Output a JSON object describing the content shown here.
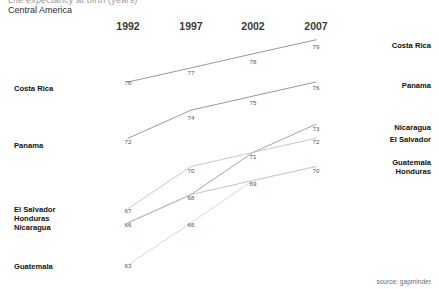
{
  "header": {
    "clipped_title": "Life expectancy at birth (years)",
    "subtitle": "Central America"
  },
  "source_note": "source: gapminder",
  "axis": {
    "years": [
      "1992",
      "1997",
      "2002",
      "2007"
    ]
  },
  "left_labels": [
    {
      "name": "Costa Rica",
      "y": 89
    },
    {
      "name": "Panama",
      "y": 146
    },
    {
      "name": "El Salvador",
      "y": 210
    },
    {
      "name": "Honduras",
      "y": 219
    },
    {
      "name": "Nicaragua",
      "y": 228
    },
    {
      "name": "Guatemala",
      "y": 267
    }
  ],
  "right_labels": [
    {
      "name": "Costa Rica",
      "y": 46
    },
    {
      "name": "Panama",
      "y": 86
    },
    {
      "name": "Nicaragua",
      "y": 128
    },
    {
      "name": "El Salvador",
      "y": 140
    },
    {
      "name": "Guatemala",
      "y": 163
    },
    {
      "name": "Honduras",
      "y": 172
    }
  ],
  "chart_data": {
    "type": "line",
    "title": "Life expectancy at birth (years)",
    "subtitle": "Central America",
    "xlabel": "",
    "ylabel": "",
    "x": [
      1992,
      1997,
      2002,
      2007
    ],
    "categories": [
      "1992",
      "1997",
      "2002",
      "2007"
    ],
    "ylim": [
      62,
      80
    ],
    "grid": false,
    "legend": "inline-side-labels",
    "annotation": "source: gapminder",
    "series": [
      {
        "name": "Costa Rica",
        "values": [
          76,
          77,
          78,
          79
        ],
        "color": "#8c8c8c"
      },
      {
        "name": "Panama",
        "values": [
          72,
          74,
          75,
          76
        ],
        "color": "#8c8c8c"
      },
      {
        "name": "Nicaragua",
        "values": [
          66,
          68,
          71,
          73
        ],
        "color": "#9a9a9a"
      },
      {
        "name": "El Salvador",
        "values": [
          67,
          70,
          71,
          72
        ],
        "color": "#c2c2c2"
      },
      {
        "name": "Honduras",
        "values": [
          66,
          68,
          69,
          70
        ],
        "color": "#bdbdbd"
      },
      {
        "name": "Guatemala",
        "values": [
          63,
          66,
          69,
          70
        ],
        "color": "#d2d2d2"
      }
    ],
    "point_labels": [
      {
        "series": "Costa Rica",
        "year": "1992",
        "text": "76",
        "x": 128,
        "y": 82
      },
      {
        "series": "Costa Rica",
        "year": "1997",
        "text": "77",
        "x": 191,
        "y": 72
      },
      {
        "series": "Costa Rica",
        "year": "2002",
        "text": "78",
        "x": 253,
        "y": 61
      },
      {
        "series": "Costa Rica",
        "year": "2007",
        "text": "79",
        "x": 316,
        "y": 46
      },
      {
        "series": "Panama",
        "year": "1992",
        "text": "72",
        "x": 128,
        "y": 141
      },
      {
        "series": "Panama",
        "year": "1997",
        "text": "74",
        "x": 191,
        "y": 117
      },
      {
        "series": "Panama",
        "year": "2002",
        "text": "75",
        "x": 253,
        "y": 102
      },
      {
        "series": "Panama",
        "year": "2007",
        "text": "76",
        "x": 316,
        "y": 87
      },
      {
        "series": "El Salvador",
        "year": "1992",
        "text": "67",
        "x": 128,
        "y": 210
      },
      {
        "series": "El Salvador",
        "year": "1997",
        "text": "70",
        "x": 191,
        "y": 170
      },
      {
        "series": "El Salvador",
        "year": "2002",
        "text": "71",
        "x": 253,
        "y": 156
      },
      {
        "series": "El Salvador",
        "year": "2007",
        "text": "72",
        "x": 316,
        "y": 141
      },
      {
        "series": "Nicaragua",
        "year": "1992",
        "text": "66",
        "x": 128,
        "y": 224
      },
      {
        "series": "Nicaragua",
        "year": "1997",
        "text": "68",
        "x": 191,
        "y": 197
      },
      {
        "series": "Nicaragua",
        "year": "2007",
        "text": "73",
        "x": 316,
        "y": 128
      },
      {
        "series": "Guatemala",
        "year": "1992",
        "text": "63",
        "x": 128,
        "y": 265
      },
      {
        "series": "Guatemala",
        "year": "1997",
        "text": "66",
        "x": 191,
        "y": 224
      },
      {
        "series": "Guatemala",
        "year": "2002",
        "text": "69",
        "x": 253,
        "y": 183
      },
      {
        "series": "Guatemala",
        "year": "2007",
        "text": "70",
        "x": 316,
        "y": 170
      }
    ]
  }
}
